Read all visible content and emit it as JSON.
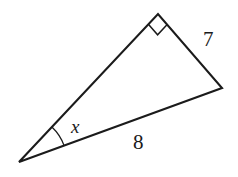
{
  "figure": {
    "kind": "right-triangle-diagram",
    "background_color": "#ffffff",
    "stroke_color": "#1b1b1b",
    "canvas": {
      "width": 238,
      "height": 177
    },
    "vertices": {
      "left": {
        "name": "left-vertex",
        "x": 19,
        "y": 162
      },
      "apex": {
        "name": "apex-vertex",
        "x": 158,
        "y": 14
      },
      "right": {
        "name": "right-vertex",
        "x": 222,
        "y": 88
      }
    },
    "right_angle": {
      "at_vertex": "apex",
      "marker": "square",
      "size": 14
    },
    "angle_arc": {
      "at_vertex": "left",
      "radius": 48
    },
    "labels": {
      "hypotenuse_side": "7",
      "base_side": "8",
      "unknown_angle": "x"
    },
    "label_positions": {
      "side_7": {
        "x": 203,
        "y": 46
      },
      "side_8": {
        "x": 133,
        "y": 149
      },
      "angle_x": {
        "x": 71,
        "y": 133
      }
    }
  }
}
